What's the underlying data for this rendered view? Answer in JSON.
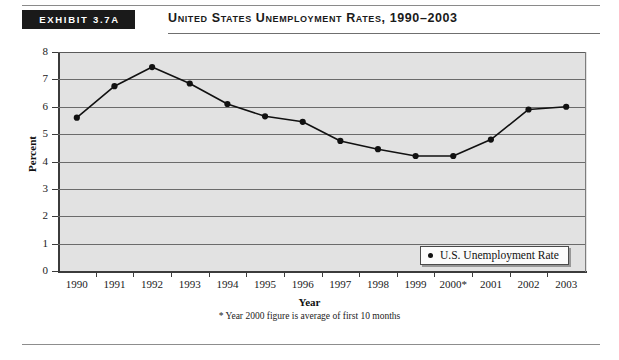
{
  "header": {
    "exhibit_badge": "EXHIBIT 3.7A",
    "title": "United States Unemployment Rates, 1990–2003"
  },
  "legend": {
    "label": "U.S. Unemployment Rate",
    "marker": "filled-circle"
  },
  "footnote": "* Year 2000 figure is average of first 10 months",
  "colors": {
    "plot_background": "#e2e2e2",
    "gridline": "#6b6b6b",
    "axis": "#3b3b3b",
    "series_line": "#111111",
    "badge_background": "#1a1a1a",
    "badge_text": "#ffffff"
  },
  "chart_data": {
    "type": "line",
    "title": "United States Unemployment Rates, 1990–2003",
    "xlabel": "Year",
    "ylabel": "Percent",
    "categories": [
      "1990",
      "1991",
      "1992",
      "1993",
      "1994",
      "1995",
      "1996",
      "1997",
      "1998",
      "1999",
      "2000*",
      "2001",
      "2002",
      "2003"
    ],
    "series": [
      {
        "name": "U.S. Unemployment Rate",
        "values": [
          5.6,
          6.75,
          7.45,
          6.85,
          6.1,
          5.65,
          5.45,
          4.75,
          4.45,
          4.2,
          4.2,
          4.8,
          5.9,
          6.0
        ]
      }
    ],
    "ylim": [
      0,
      8
    ],
    "yticks": [
      0,
      1,
      2,
      3,
      4,
      5,
      6,
      7,
      8
    ],
    "grid": true,
    "legend_position": "inside-bottom-right",
    "annotation": "* Year 2000 figure is average of first 10 months"
  }
}
